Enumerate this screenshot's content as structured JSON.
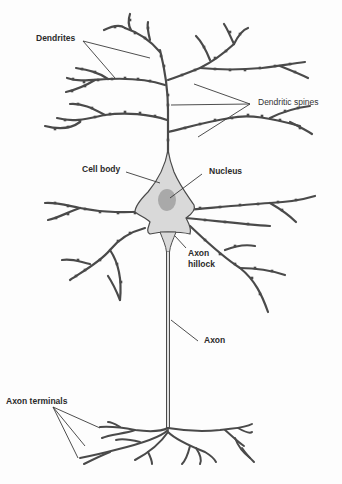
{
  "diagram": {
    "colors": {
      "stroke": "#4a4a4a",
      "cell_body_fill": "#d9d9d9",
      "nucleus_fill": "#a9a9a9",
      "leader_line": "#3a3a3a",
      "label_text": "#2b2b2b"
    },
    "labels": {
      "dendrites": "Dendrites",
      "dendritic_spines": "Dendritic spines",
      "cell_body": "Cell body",
      "nucleus": "Nucleus",
      "axon_hillock_line1": "Axon",
      "axon_hillock_line2": "hillock",
      "axon": "Axon",
      "axon_terminals": "Axon terminals"
    }
  }
}
